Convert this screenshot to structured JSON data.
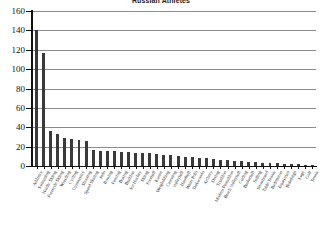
{
  "chart_data": {
    "type": "bar",
    "title": "Russian Athletes",
    "xlabel": "",
    "ylabel": "",
    "ylim": [
      0,
      160
    ],
    "ytick_step": 20,
    "yticks": [
      0,
      20,
      40,
      60,
      80,
      100,
      120,
      140,
      160
    ],
    "grid": true,
    "grid_axis": "y",
    "legend": false,
    "bar_color": "#3a3a3a",
    "categories": [
      "Athletics",
      "Swimming",
      "Nordic Skiing",
      "Freestyle Skiing",
      "Wrestling",
      "Cycling",
      "Gymnastics",
      "Shooting",
      "Speed Skating",
      "Judo",
      "Rowing",
      "Fencing",
      "Boxing",
      "Biathlon",
      "Ice Hockey",
      "Skiing",
      "Football",
      "Karate",
      "Weightlifting",
      "Canoeing",
      "Volleyball",
      "Handball",
      "Water Polo",
      "Taekwondo",
      "Archery",
      "Diving",
      "Triathlon",
      "Modern Pentathlon",
      "Beach Volleyball",
      "Curling",
      "Basketball",
      "Sailing",
      "Snowboard",
      "Table Tennis",
      "Badminton",
      "Equestrian",
      "Bobsleigh",
      "Luge",
      "Golf",
      "Tennis"
    ],
    "values": [
      140,
      117,
      36,
      33,
      29,
      28,
      27,
      26,
      17,
      16,
      16,
      15,
      14,
      14,
      13,
      13,
      13,
      12,
      11,
      11,
      10,
      9,
      9,
      8,
      8,
      7,
      6,
      6,
      5,
      5,
      4,
      4,
      3,
      3,
      3,
      2,
      2,
      2,
      1,
      1
    ]
  }
}
